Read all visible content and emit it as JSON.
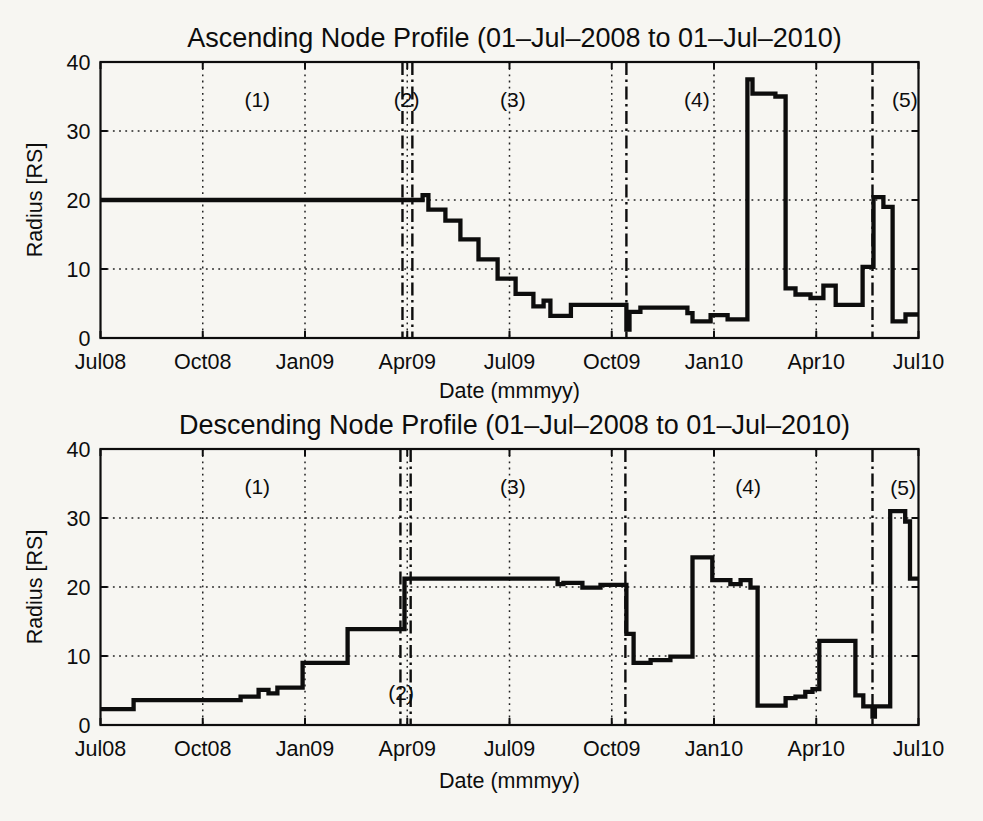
{
  "figure": {
    "background": "#f7f6f2",
    "ink_color": "#0d0d0d",
    "x_unit": "months since 01-Jul-2008"
  },
  "chart_data": [
    {
      "id": "ascending",
      "type": "line",
      "line_style": "thick black step line",
      "title": "Ascending Node Profile (01–Jul–2008 to 01–Jul–2010)",
      "xlabel": "Date (mmmyy)",
      "ylabel": "Radius [RS]",
      "ylim": [
        0,
        40
      ],
      "yticks": [
        0,
        10,
        20,
        30,
        40
      ],
      "xlim_months": [
        0,
        24
      ],
      "xticks": [
        {
          "m": 0,
          "label": "Jul08"
        },
        {
          "m": 3,
          "label": "Oct08"
        },
        {
          "m": 6,
          "label": "Jan09"
        },
        {
          "m": 9,
          "label": "Apr09"
        },
        {
          "m": 12,
          "label": "Jul09"
        },
        {
          "m": 15,
          "label": "Oct09"
        },
        {
          "m": 18,
          "label": "Jan10"
        },
        {
          "m": 21,
          "label": "Apr10"
        },
        {
          "m": 24,
          "label": "Jul10"
        }
      ],
      "grid": "dotted",
      "dividers_months": [
        8.86,
        9.15,
        15.43,
        22.65
      ],
      "region_labels": [
        {
          "text": "(1)",
          "m": 4.6,
          "r": 34.5
        },
        {
          "text": "(2)",
          "m": 8.98,
          "r": 34.5
        },
        {
          "text": "(3)",
          "m": 12.1,
          "r": 34.5
        },
        {
          "text": "(4)",
          "m": 17.5,
          "r": 34.5
        },
        {
          "text": "(5)",
          "m": 23.6,
          "r": 34.5
        }
      ],
      "steps_month_radius": [
        [
          0,
          20
        ],
        [
          9.45,
          20.7
        ],
        [
          9.62,
          18.6
        ],
        [
          10.12,
          17.0
        ],
        [
          10.56,
          14.3
        ],
        [
          11.09,
          11.4
        ],
        [
          11.65,
          8.6
        ],
        [
          12.18,
          6.4
        ],
        [
          12.7,
          4.6
        ],
        [
          13.0,
          5.4
        ],
        [
          13.2,
          3.2
        ],
        [
          13.8,
          4.8
        ],
        [
          15.43,
          1.2
        ],
        [
          15.52,
          3.8
        ],
        [
          15.84,
          4.4
        ],
        [
          17.22,
          3.6
        ],
        [
          17.37,
          2.4
        ],
        [
          17.9,
          3.3
        ],
        [
          18.4,
          2.7
        ],
        [
          18.98,
          37.5
        ],
        [
          19.13,
          35.4
        ],
        [
          19.8,
          35.0
        ],
        [
          20.1,
          7.2
        ],
        [
          20.39,
          6.3
        ],
        [
          20.83,
          5.8
        ],
        [
          21.21,
          7.6
        ],
        [
          21.57,
          4.8
        ],
        [
          22.36,
          10.3
        ],
        [
          22.68,
          20.4
        ],
        [
          22.97,
          19.0
        ],
        [
          23.24,
          2.4
        ],
        [
          23.62,
          3.4
        ]
      ]
    },
    {
      "id": "descending",
      "type": "line",
      "line_style": "thick black step line",
      "title": "Descending Node Profile (01–Jul–2008 to 01–Jul–2010)",
      "xlabel": "Date (mmmyy)",
      "ylabel": "Radius [RS]",
      "ylim": [
        0,
        40
      ],
      "yticks": [
        0,
        10,
        20,
        30,
        40
      ],
      "xlim_months": [
        0,
        24
      ],
      "xticks": [
        {
          "m": 0,
          "label": "Jul08"
        },
        {
          "m": 3,
          "label": "Oct08"
        },
        {
          "m": 6,
          "label": "Jan09"
        },
        {
          "m": 9,
          "label": "Apr09"
        },
        {
          "m": 12,
          "label": "Jul09"
        },
        {
          "m": 15,
          "label": "Oct09"
        },
        {
          "m": 18,
          "label": "Jan10"
        },
        {
          "m": 21,
          "label": "Apr10"
        },
        {
          "m": 24,
          "label": "Jul10"
        }
      ],
      "grid": "dotted",
      "dividers_months": [
        8.8,
        9.1,
        15.4,
        22.65
      ],
      "region_labels": [
        {
          "text": "(1)",
          "m": 4.6,
          "r": 34.5
        },
        {
          "text": "(2)",
          "m": 8.82,
          "r": 4.7
        },
        {
          "text": "(3)",
          "m": 12.1,
          "r": 34.5
        },
        {
          "text": "(4)",
          "m": 19.0,
          "r": 34.5
        },
        {
          "text": "(5)",
          "m": 23.55,
          "r": 34.3
        }
      ],
      "steps_month_radius": [
        [
          0,
          2.3
        ],
        [
          0.97,
          3.6
        ],
        [
          4.11,
          4.1
        ],
        [
          4.64,
          5.1
        ],
        [
          4.93,
          4.6
        ],
        [
          5.19,
          5.4
        ],
        [
          5.93,
          9.0
        ],
        [
          7.25,
          13.9
        ],
        [
          8.92,
          21.2
        ],
        [
          13.41,
          20.4
        ],
        [
          13.58,
          20.6
        ],
        [
          14.14,
          19.9
        ],
        [
          14.67,
          20.3
        ],
        [
          15.43,
          13.2
        ],
        [
          15.64,
          9.0
        ],
        [
          16.14,
          9.4
        ],
        [
          16.72,
          9.9
        ],
        [
          17.37,
          24.3
        ],
        [
          17.95,
          21.0
        ],
        [
          18.48,
          20.4
        ],
        [
          18.78,
          21.0
        ],
        [
          19.07,
          19.9
        ],
        [
          19.28,
          2.8
        ],
        [
          20.1,
          3.9
        ],
        [
          20.39,
          4.1
        ],
        [
          20.68,
          4.8
        ],
        [
          20.89,
          5.2
        ],
        [
          21.09,
          12.2
        ],
        [
          22.15,
          4.3
        ],
        [
          22.38,
          2.7
        ],
        [
          22.65,
          1.2
        ],
        [
          22.72,
          2.7
        ],
        [
          23.17,
          31.0
        ],
        [
          23.61,
          29.5
        ],
        [
          23.75,
          21.2
        ]
      ]
    }
  ]
}
